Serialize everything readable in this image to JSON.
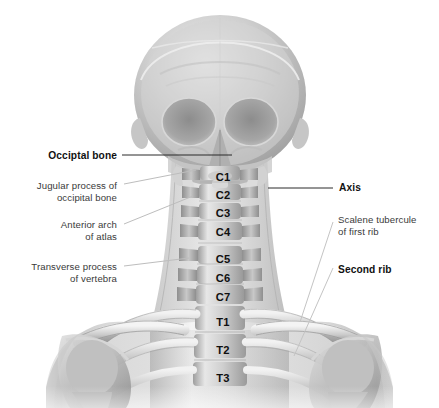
{
  "figure": {
    "view": "skeletal radiographic illustration",
    "background_color": "#ffffff",
    "bone_color_light": "#e9e9e9",
    "bone_color_mid": "#b6b6b6",
    "bone_color_dark": "#8a8a8a",
    "label_color": "#1a1a1a",
    "leader_color": "#2a2a2a",
    "leader_color_faint": "#b9b9b9"
  },
  "labels_left": [
    {
      "text": "Occiptal bone",
      "style": "bold",
      "x": 33,
      "y": 149,
      "width": 84
    },
    {
      "text": "Jugular process of\noccipital bone",
      "style": "regular",
      "x": 20,
      "y": 180,
      "width": 97
    },
    {
      "text": "Anterior arch\nof atlas",
      "style": "regular",
      "x": 30,
      "y": 219,
      "width": 87
    },
    {
      "text": "Transverse process\nof vertebra",
      "style": "regular",
      "x": 16,
      "y": 261,
      "width": 101
    }
  ],
  "labels_right": [
    {
      "text": "Axis",
      "style": "bold",
      "x": 339,
      "y": 181,
      "width": 40
    },
    {
      "text": "Scalene tubercule\nof first rib",
      "style": "regular",
      "x": 338,
      "y": 214,
      "width": 96
    },
    {
      "text": "Second rib",
      "style": "bold",
      "x": 338,
      "y": 263,
      "width": 70
    }
  ],
  "vertebra_levels": [
    {
      "label": "C1",
      "x": 206,
      "y": 171
    },
    {
      "label": "C2",
      "x": 206,
      "y": 189
    },
    {
      "label": "C3",
      "x": 206,
      "y": 207
    },
    {
      "label": "C4",
      "x": 206,
      "y": 226
    },
    {
      "label": "C5",
      "x": 206,
      "y": 253
    },
    {
      "label": "C6",
      "x": 206,
      "y": 272
    },
    {
      "label": "C7",
      "x": 206,
      "y": 291
    },
    {
      "label": "T1",
      "x": 206,
      "y": 316
    },
    {
      "label": "T2",
      "x": 206,
      "y": 344
    },
    {
      "label": "T3",
      "x": 206,
      "y": 372
    }
  ],
  "leaders": [
    {
      "name": "occipital-bone-leader",
      "x1": 122,
      "y1": 155,
      "x2": 232,
      "y2": 155,
      "tone": "dark"
    },
    {
      "name": "jugular-process-leader",
      "x1": 124,
      "y1": 184,
      "x2": 196,
      "y2": 169,
      "tone": "faint"
    },
    {
      "name": "anterior-arch-leader",
      "x1": 124,
      "y1": 224,
      "x2": 192,
      "y2": 196,
      "tone": "faint"
    },
    {
      "name": "transverse-process-leader",
      "x1": 124,
      "y1": 266,
      "x2": 188,
      "y2": 258,
      "tone": "faint"
    },
    {
      "name": "axis-leader",
      "x1": 268,
      "y1": 188,
      "x2": 333,
      "y2": 188,
      "tone": "dark"
    },
    {
      "name": "scalene-tubercule-leader",
      "x1": 300,
      "y1": 320,
      "x2": 333,
      "y2": 222,
      "tone": "faint"
    },
    {
      "name": "second-rib-leader",
      "x1": 296,
      "y1": 352,
      "x2": 333,
      "y2": 268,
      "tone": "faint"
    }
  ]
}
